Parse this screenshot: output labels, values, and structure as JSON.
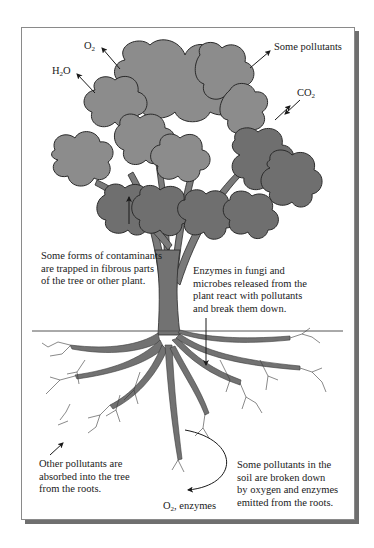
{
  "diagram": {
    "type": "phytoremediation-illustration",
    "labels": {
      "o2_top": {
        "base": "O",
        "sub": "2"
      },
      "h2o": {
        "pre": "H",
        "sub": "2",
        "post": "O"
      },
      "some_pollutants": "Some pollutants",
      "co2": {
        "base": "CO",
        "sub": "2"
      },
      "contaminants_trapped": [
        "Some forms of contaminants",
        "are trapped in fibrous parts",
        "of the tree or other plant."
      ],
      "enzymes_fungi": [
        "Enzymes in fungi and",
        "microbes released from the",
        "plant react with pollutants",
        "and break them down."
      ],
      "other_pollutants": [
        "Other pollutants are",
        "absorbed into the tree",
        "from the roots."
      ],
      "o2_enzymes": {
        "base": "O",
        "sub": "2",
        "post": ", enzymes"
      },
      "soil_breakdown": [
        "Some pollutants in the",
        "soil are broken down",
        "by oxygen and enzymes",
        "emitted from the roots."
      ]
    },
    "colors": {
      "canopy_light": "#8c8c8c",
      "canopy_dark": "#6f6f6f",
      "trunk": "#727272",
      "outline": "#2a2a2a",
      "ground_line": "#555555",
      "frame_shadow": "#6f6f6f"
    }
  }
}
